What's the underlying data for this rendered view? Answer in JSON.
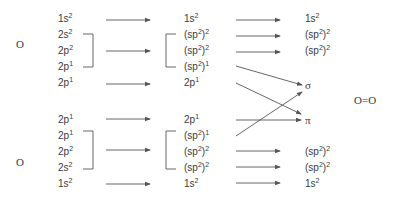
{
  "diagram": {
    "left_atom_top": "O",
    "left_atom_bottom": "O",
    "product": "O=O",
    "sigma": "σ",
    "pi": "π",
    "top_atom": {
      "ground": [
        {
          "orb": "1s",
          "occ": "2"
        },
        {
          "orb": "2s",
          "occ": "2"
        },
        {
          "orb": "2p",
          "occ": "2"
        },
        {
          "orb": "2p",
          "occ": "1"
        },
        {
          "orb": "2p",
          "occ": "1"
        }
      ],
      "hybrid": [
        {
          "orb": "1s",
          "occ": "2"
        },
        {
          "orb": "(sp",
          "hyb": "2",
          "close": ")",
          "occ": "2"
        },
        {
          "orb": "(sp",
          "hyb": "2",
          "close": ")",
          "occ": "2"
        },
        {
          "orb": "(sp",
          "hyb": "2",
          "close": ")",
          "occ": "1"
        },
        {
          "orb": "2p",
          "occ": "1"
        }
      ],
      "result": [
        {
          "orb": "1s",
          "occ": "2"
        },
        {
          "orb": "(sp",
          "hyb": "2",
          "close": ")",
          "occ": "2"
        },
        {
          "orb": "(sp",
          "hyb": "2",
          "close": ")",
          "occ": "2"
        }
      ]
    },
    "bottom_atom": {
      "ground": [
        {
          "orb": "2p",
          "occ": "1"
        },
        {
          "orb": "2p",
          "occ": "1"
        },
        {
          "orb": "2p",
          "occ": "2"
        },
        {
          "orb": "2s",
          "occ": "2"
        },
        {
          "orb": "1s",
          "occ": "2"
        }
      ],
      "hybrid": [
        {
          "orb": "2p",
          "occ": "1"
        },
        {
          "orb": "(sp",
          "hyb": "2",
          "close": ")",
          "occ": "1"
        },
        {
          "orb": "(sp",
          "hyb": "2",
          "close": ")",
          "occ": "2"
        },
        {
          "orb": "(sp",
          "hyb": "2",
          "close": ")",
          "occ": "2"
        },
        {
          "orb": "1s",
          "occ": "2"
        }
      ],
      "result": [
        {
          "orb": "(sp",
          "hyb": "2",
          "close": ")",
          "occ": "2"
        },
        {
          "orb": "(sp",
          "hyb": "2",
          "close": ")",
          "occ": "2"
        },
        {
          "orb": "1s",
          "occ": "2"
        }
      ]
    },
    "colors": {
      "text": "#3a3a3a",
      "line": "#555555"
    }
  }
}
